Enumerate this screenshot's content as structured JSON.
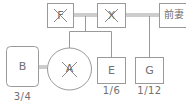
{
  "diagram": {
    "type": "family-tree",
    "nodes": {
      "F": {
        "label": "F",
        "deceased": true,
        "shape": "rect"
      },
      "X": {
        "label": "X",
        "deceased": true,
        "shape": "rect"
      },
      "former_wife": {
        "label": "前妻",
        "deceased": false,
        "shape": "rect"
      },
      "A": {
        "label": "A",
        "deceased": true,
        "shape": "ellipse"
      },
      "B": {
        "label": "B",
        "deceased": false,
        "shape": "rounded-rect",
        "share": "3/4"
      },
      "E": {
        "label": "E",
        "deceased": false,
        "shape": "rect",
        "share": "1/6"
      },
      "G": {
        "label": "G",
        "deceased": false,
        "shape": "rect",
        "share": "1/12"
      }
    },
    "colors": {
      "line": "#9a9a9a",
      "text": "#707070",
      "cross": "#8a8a8a"
    }
  }
}
